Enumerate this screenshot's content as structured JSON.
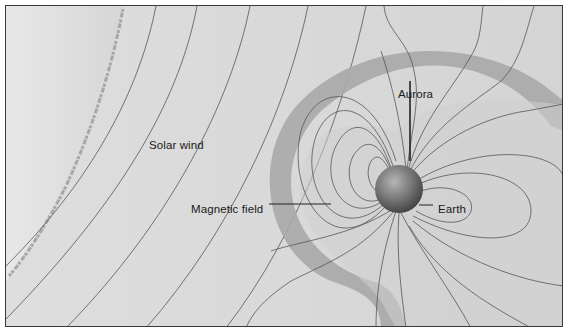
{
  "diagram": {
    "labels": {
      "solar_wind": "Solar wind",
      "aurora": "Aurora",
      "magnetic_field": "Magnetic field",
      "earth": "Earth"
    },
    "colors": {
      "background": "#dcdcdc",
      "sun": "#e4e4e4",
      "sun_edge": "#9a9a9a",
      "magnetosheath": "#a9a9a9",
      "magnetosphere_inner": "#cfcfcf",
      "field_lines": "#555555",
      "earth": "#6a6a6a",
      "frame": "#3a3a3a"
    }
  }
}
